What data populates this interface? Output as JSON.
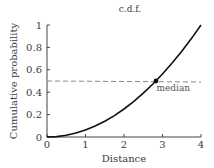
{
  "chart_data": {
    "type": "line",
    "title": "c.d.f.",
    "xlabel": "Distance",
    "ylabel": "Cumulative probability",
    "xlim": [
      0,
      4
    ],
    "ylim": [
      0,
      1
    ],
    "x_ticks": [
      "0",
      "1",
      "2",
      "3",
      "4"
    ],
    "y_ticks": [
      "0",
      "0.2",
      "0.4",
      "0.6",
      "0.8",
      "1"
    ],
    "grid": false,
    "series": [
      {
        "name": "cdf",
        "x": [
          0,
          0.25,
          0.5,
          0.75,
          1,
          1.25,
          1.5,
          1.75,
          2,
          2.25,
          2.5,
          2.75,
          3,
          3.25,
          3.5,
          3.75,
          4
        ],
        "y": [
          0,
          0.004,
          0.016,
          0.035,
          0.0625,
          0.098,
          0.141,
          0.191,
          0.25,
          0.316,
          0.391,
          0.473,
          0.5625,
          0.66,
          0.766,
          0.879,
          1.0
        ]
      }
    ],
    "reference_line": {
      "y": 0.5,
      "style": "dashed"
    },
    "annotations": [
      {
        "label": "median",
        "x": 2.83,
        "y": 0.5
      }
    ]
  }
}
